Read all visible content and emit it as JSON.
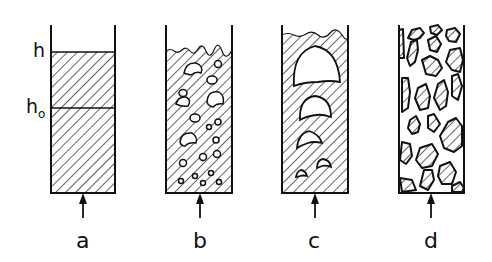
{
  "figure": {
    "panels": [
      {
        "id": "a",
        "label": "a",
        "regime": "packed / expanded bed"
      },
      {
        "id": "b",
        "label": "b",
        "regime": "bubbling bed"
      },
      {
        "id": "c",
        "label": "c",
        "regime": "slugging bed"
      },
      {
        "id": "d",
        "label": "d",
        "regime": "turbulent / lean bed"
      }
    ],
    "height_labels": {
      "h": "h",
      "h0_base": "h",
      "h0_sub": "o"
    }
  },
  "colors": {
    "line": "#111111",
    "background": "#ffffff"
  }
}
